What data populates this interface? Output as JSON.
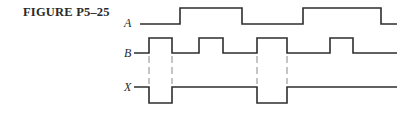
{
  "figure": {
    "title": "FIGURE P5–25"
  },
  "signals": [
    {
      "name": "A",
      "high_y": 8,
      "low_y": 24,
      "start_level": "low",
      "transitions_x": [
        180,
        242,
        303,
        381
      ],
      "x_start": 140,
      "x_end": 397
    },
    {
      "name": "B",
      "high_y": 38,
      "low_y": 53,
      "start_level": "low",
      "transitions_x": [
        149,
        172,
        199,
        223,
        257,
        287,
        330,
        353
      ],
      "x_start": 134,
      "x_end": 397
    },
    {
      "name": "X",
      "high_y": 87,
      "low_y": 103,
      "start_level": "high",
      "transitions_x": [
        149,
        172,
        257,
        287
      ],
      "x_start": 134,
      "x_end": 397
    }
  ],
  "labels": {
    "A": "A",
    "B": "B",
    "X": "X"
  },
  "guides_x": [
    149,
    172,
    257,
    287
  ],
  "colors": {
    "ink": "#2e2e2e",
    "guide": "#8a8a8a",
    "background": "#ffffff"
  }
}
